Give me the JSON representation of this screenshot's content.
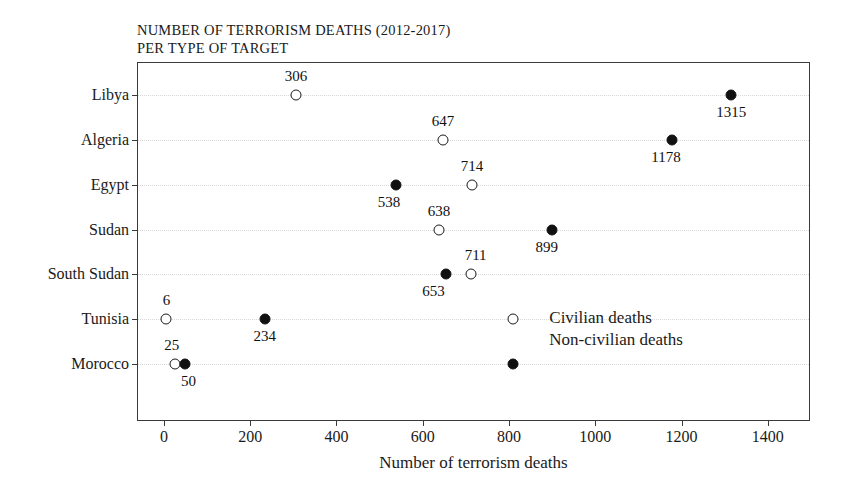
{
  "chart_data": {
    "type": "scatter",
    "title": "NUMBER OF TERRORISM DEATHS (2012-2017) PER TYPE OF TARGET",
    "title_line1": "NUMBER OF TERRORISM DEATHS (2012-2017)",
    "title_line2": "PER TYPE OF TARGET",
    "xlabel": "Number of terrorism deaths",
    "ylabel": "",
    "xlim": [
      -60,
      1500
    ],
    "ylim": [
      0,
      8
    ],
    "grid": true,
    "legend_position": "inside-bottom-right",
    "categories": [
      "Libya",
      "Algeria",
      "Egypt",
      "Sudan",
      "South Sudan",
      "Tunisia",
      "Morocco"
    ],
    "xticks": [
      "0",
      "200",
      "400",
      "600",
      "800",
      "1000",
      "1200",
      "1400"
    ],
    "xtick_values": [
      0,
      200,
      400,
      600,
      800,
      1000,
      1200,
      1400
    ],
    "series": [
      {
        "name": "Civilian deaths",
        "marker": "open-circle",
        "values": [
          306,
          647,
          714,
          638,
          711,
          6,
          25
        ]
      },
      {
        "name": "Non-civilian deaths",
        "marker": "filled-circle",
        "values": [
          1315,
          1178,
          538,
          899,
          653,
          234,
          50
        ]
      }
    ],
    "points": [
      {
        "category": "Libya",
        "series": "Civilian deaths",
        "value": 306,
        "label": "306",
        "label_pos": "above",
        "label_dx": 0
      },
      {
        "category": "Libya",
        "series": "Non-civilian deaths",
        "value": 1315,
        "label": "1315",
        "label_pos": "below",
        "label_dx": 0
      },
      {
        "category": "Algeria",
        "series": "Civilian deaths",
        "value": 647,
        "label": "647",
        "label_pos": "above",
        "label_dx": 0
      },
      {
        "category": "Algeria",
        "series": "Non-civilian deaths",
        "value": 1178,
        "label": "1178",
        "label_pos": "below",
        "label_dx": -6
      },
      {
        "category": "Egypt",
        "series": "Civilian deaths",
        "value": 714,
        "label": "714",
        "label_pos": "above",
        "label_dx": 0
      },
      {
        "category": "Egypt",
        "series": "Non-civilian deaths",
        "value": 538,
        "label": "538",
        "label_pos": "below",
        "label_dx": -7
      },
      {
        "category": "Sudan",
        "series": "Civilian deaths",
        "value": 638,
        "label": "638",
        "label_pos": "above",
        "label_dx": 0
      },
      {
        "category": "Sudan",
        "series": "Non-civilian deaths",
        "value": 899,
        "label": "899",
        "label_pos": "below",
        "label_dx": -5
      },
      {
        "category": "South Sudan",
        "series": "Civilian deaths",
        "value": 711,
        "label": "711",
        "label_pos": "above",
        "label_dx": 5
      },
      {
        "category": "South Sudan",
        "series": "Non-civilian deaths",
        "value": 653,
        "label": "653",
        "label_pos": "below",
        "label_dx": -12
      },
      {
        "category": "Tunisia",
        "series": "Civilian deaths",
        "value": 6,
        "label": "6",
        "label_pos": "above",
        "label_dx": 0
      },
      {
        "category": "Tunisia",
        "series": "Non-civilian deaths",
        "value": 234,
        "label": "234",
        "label_pos": "below",
        "label_dx": 0
      },
      {
        "category": "Morocco",
        "series": "Civilian deaths",
        "value": 25,
        "label": "25",
        "label_pos": "above",
        "label_dx": -3
      },
      {
        "category": "Morocco",
        "series": "Non-civilian deaths",
        "value": 50,
        "label": "50",
        "label_pos": "below",
        "label_dx": 3
      }
    ],
    "legend_markers": [
      {
        "series": "Civilian deaths",
        "value": 810,
        "row": "Tunisia"
      },
      {
        "series": "Non-civilian deaths",
        "value": 810,
        "row": "Morocco"
      }
    ],
    "legend": [
      {
        "label": "Civilian deaths",
        "marker": "open-circle"
      },
      {
        "label": "Non-civilian deaths",
        "marker": "filled-circle"
      }
    ],
    "colors": {
      "filled_marker": "#111111",
      "open_marker_stroke": "#1a1a1a",
      "axis": "#3a3a3a",
      "grid": "#d8d8d8",
      "text": "#111111",
      "background": "#ffffff"
    }
  }
}
